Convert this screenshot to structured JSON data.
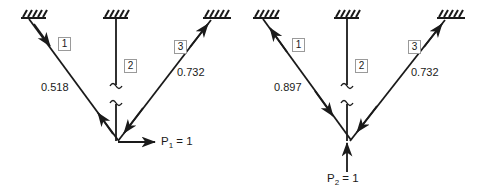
{
  "figure": {
    "background_color": "#ffffff",
    "line_color": "#1a1a1a",
    "label_box_border": "#9a9a9a"
  },
  "panels": [
    {
      "id": "left",
      "load": {
        "symbol": "P",
        "subscript": "1",
        "value": "1",
        "text_prefix": "P",
        "text_suffix": " = 1",
        "direction": "horizontal-right"
      },
      "members": [
        {
          "number": "1",
          "force": "0.518",
          "state": "compression",
          "support": "hatched-left"
        },
        {
          "number": "2",
          "force": "",
          "state": "broken",
          "support": "hatched-top"
        },
        {
          "number": "3",
          "force": "0.732",
          "state": "tension",
          "support": "hatched-right"
        }
      ]
    },
    {
      "id": "right",
      "load": {
        "symbol": "P",
        "subscript": "2",
        "value": "1",
        "text_prefix": "P",
        "text_suffix": " = 1",
        "direction": "vertical-up"
      },
      "members": [
        {
          "number": "1",
          "force": "0.897",
          "state": "tension",
          "support": "hatched-left"
        },
        {
          "number": "2",
          "force": "",
          "state": "broken",
          "support": "hatched-top"
        },
        {
          "number": "3",
          "force": "0.732",
          "state": "tension",
          "support": "hatched-right"
        }
      ]
    }
  ],
  "labels": {
    "left_member1_number": "1",
    "left_member2_number": "2",
    "left_member3_number": "3",
    "left_member1_force": "0.518",
    "left_member3_force": "0.732",
    "left_load_text": "P",
    "left_load_sub": "1",
    "left_load_eq": " = 1",
    "right_member1_number": "1",
    "right_member2_number": "2",
    "right_member3_number": "3",
    "right_member1_force": "0.897",
    "right_member3_force": "0.732",
    "right_load_text": "P",
    "right_load_sub": "2",
    "right_load_eq": " = 1"
  }
}
